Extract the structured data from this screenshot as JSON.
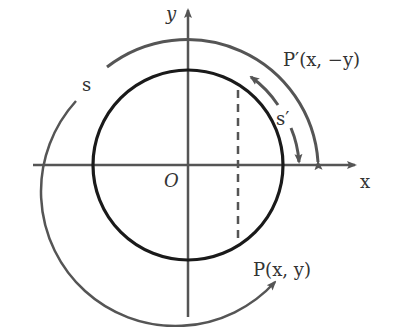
{
  "diagram": {
    "type": "unit-circle-arc-length",
    "colors": {
      "axis": "#555555",
      "circle": "#1a1a1a",
      "arc": "#555555",
      "text": "#333333"
    },
    "labels": {
      "x_axis": "x",
      "y_axis": "y",
      "origin": "O",
      "arc_s": "s",
      "arc_s_prime": "s′",
      "point_p": "P(x, y)",
      "point_p_prime": "P′(x, −y)"
    }
  }
}
